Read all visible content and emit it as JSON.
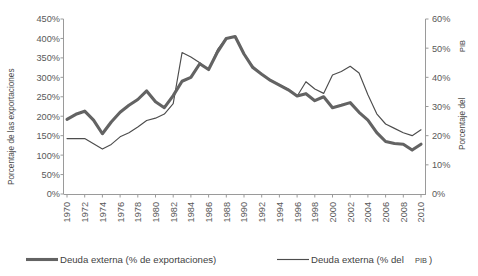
{
  "chart_data": {
    "type": "line",
    "title": "",
    "xlabel": "",
    "ylabel": "Porcentaje de las exportaciones",
    "y2label_main": "Porcentaje del ",
    "y2label_small": "PIB",
    "grid": false,
    "legend_position": "bottom",
    "x": [
      1970,
      1971,
      1972,
      1973,
      1974,
      1975,
      1976,
      1977,
      1978,
      1979,
      1980,
      1981,
      1982,
      1983,
      1984,
      1985,
      1986,
      1987,
      1988,
      1989,
      1990,
      1991,
      1992,
      1993,
      1994,
      1995,
      1996,
      1997,
      1998,
      1999,
      2000,
      2001,
      2002,
      2003,
      2004,
      2005,
      2006,
      2007,
      2008,
      2009,
      2010
    ],
    "xtick_labels": [
      "1970",
      "1972",
      "1974",
      "1976",
      "1978",
      "1980",
      "1982",
      "1984",
      "1986",
      "1988",
      "1990",
      "1992",
      "1994",
      "1996",
      "1998",
      "2000",
      "2002",
      "2004",
      "2006",
      "2008",
      "2010"
    ],
    "yticks_left": [
      "0%",
      "50%",
      "100%",
      "150%",
      "200%",
      "250%",
      "300%",
      "350%",
      "400%",
      "450%"
    ],
    "yticks_right": [
      "0%",
      "10%",
      "20%",
      "30%",
      "40%",
      "50%",
      "60%"
    ],
    "ylim_left": [
      0,
      450
    ],
    "ylim_right": [
      0,
      60
    ],
    "series": [
      {
        "name": "Deuda externa (% de exportaciones)",
        "axis": "left",
        "units": "percent_of_exports",
        "color": "#636363",
        "line_width": "thick",
        "values": [
          192,
          205,
          213,
          190,
          155,
          185,
          210,
          228,
          243,
          265,
          237,
          222,
          253,
          290,
          300,
          335,
          320,
          365,
          400,
          405,
          360,
          325,
          308,
          292,
          280,
          268,
          252,
          258,
          240,
          250,
          222,
          228,
          235,
          210,
          190,
          158,
          135,
          130,
          128,
          113,
          128
        ]
      },
      {
        "name": "Deuda externa (% del PIB)",
        "axis": "right",
        "units": "percent_of_gdp",
        "color": "#4d4d4d",
        "line_width": "thin",
        "values": [
          19.0,
          19.0,
          19.0,
          17.2,
          15.4,
          17.0,
          19.6,
          21.0,
          23.0,
          25.2,
          26.0,
          27.4,
          31.0,
          48.5,
          47.0,
          45.0,
          42.5,
          49.5,
          53.5,
          54.0,
          48.0,
          43.8,
          41.0,
          39.0,
          37.5,
          36.0,
          33.5,
          38.5,
          36.0,
          34.5,
          40.8,
          42.0,
          43.8,
          41.5,
          34.0,
          27.5,
          24.0,
          22.5,
          21.0,
          20.0,
          22.0
        ]
      }
    ],
    "legend": [
      {
        "label": "Deuda externa (% de exportaciones)",
        "style": "thick"
      },
      {
        "label_main": "Deuda externa (% del ",
        "label_small": "PIB",
        "label_tail": ")",
        "style": "thin"
      }
    ]
  }
}
